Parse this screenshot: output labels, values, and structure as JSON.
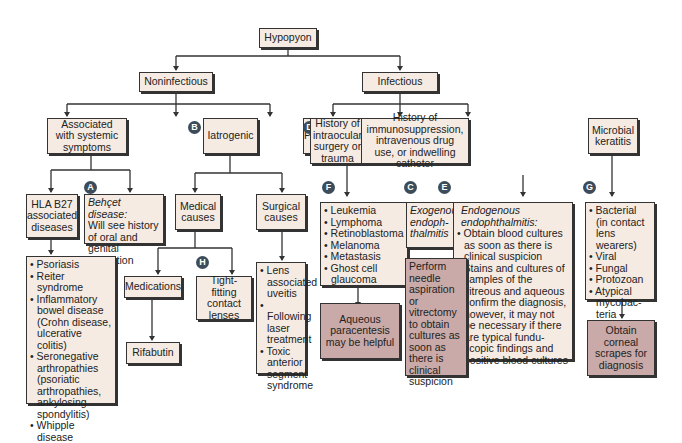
{
  "root": "Hypopyon",
  "level1": {
    "noninfectious": "Noninfectious",
    "infectious": "Infectious"
  },
  "noninfectious": {
    "systemic": "Associated with systemic symptoms",
    "iatrogenic": "Iatrogenic",
    "pseudo": "Pseudohypopyon",
    "hla": "HLA B27 associated diseases",
    "behcet_title": "Behçet disease:",
    "behcet_body": "Will see history of oral and genital ulceration",
    "hla_list": [
      "Psoriasis",
      "Reiter syndrome",
      "Inflammatory bowel disease (Crohn disease, ulcerative colitis)",
      "Seronegative arthropathies (psoriatic arthropathies, ankylosing spondylitis)",
      "Whipple disease"
    ],
    "medical": "Medical causes",
    "surgical": "Surgical causes",
    "medications": "Medications",
    "contact": "Tight-fitting contact lenses",
    "rifabutin": "Rifabutin",
    "surgical_list": [
      "Lens associated uveitis",
      "Following laser treatment",
      "Toxic anterior segment syndrome"
    ],
    "pseudo_list": [
      "Leukemia",
      "Lymphoma",
      "Retinoblastoma",
      "Melanoma",
      "Metastasis",
      "Ghost cell glaucoma"
    ],
    "aqueous": "Aqueous paracentesis may be helpful"
  },
  "infectious": {
    "history_surgery": "History of intraocular surgery or trauma",
    "history_immuno": "History of immunosuppression, intravenous drug use, or indwelling catheter",
    "microbial": "Microbial keratitis",
    "exogenous": "Exogenous endoph-thalmitis",
    "endo_title": "Endogenous endophthalmitis:",
    "endo_list": [
      "Obtain blood cultures as soon as there is clinical suspicion",
      "Stains and cultures of samples of the vitreous and aqueous confirm the diagnosis, however, it may not be necessary if there are typical fundu-scopic findings and positive blood cultures"
    ],
    "perform": "Perform needle aspiration or vitrectomy to obtain cultures as soon as there is clinical suspicion",
    "microbial_list": [
      "Bacterial (in contact lens wearers)",
      "Viral",
      "Fungal",
      "Protozoan",
      "Atypical mycobac-teria"
    ],
    "corneal": "Obtain corneal scrapes for diagnosis"
  },
  "badges": {
    "a": "A",
    "b": "B",
    "c": "C",
    "d": "D",
    "e": "E",
    "f": "F",
    "g": "G",
    "h": "H"
  }
}
